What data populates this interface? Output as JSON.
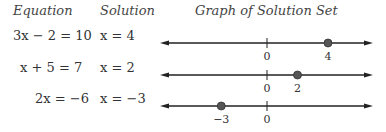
{
  "headers": {
    "equation": "Equation",
    "solution": "Solution",
    "graph": "Graph of Solution Set"
  },
  "rows": [
    {
      "equation": "3x − 2 = 10",
      "solution": "x = 4",
      "value": 4,
      "labels": [
        {
          "v": 0,
          "t": "0"
        },
        {
          "v": 4,
          "t": "4"
        }
      ]
    },
    {
      "equation": "x + 5 = 7",
      "solution": "x = 2",
      "value": 2,
      "labels": [
        {
          "v": 0,
          "t": "0"
        },
        {
          "v": 2,
          "t": "2"
        }
      ]
    },
    {
      "equation": "2x = −6",
      "solution": "x = −3",
      "value": -3,
      "labels": [
        {
          "v": -3,
          "t": "−3"
        },
        {
          "v": 0,
          "t": "0"
        }
      ]
    }
  ],
  "style": {
    "line_color": "#222222",
    "dot_color": "#555555"
  }
}
